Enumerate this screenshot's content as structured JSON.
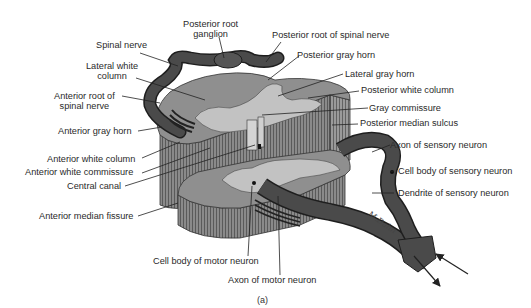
{
  "figure": {
    "caption": "(a)",
    "signature": "M.Dahn",
    "colors": {
      "white_matter": "#8f8f8f",
      "gray_matter": "#bdbdbd",
      "nerve": "#4a4a4a",
      "nerve_outline": "#1e1e1e",
      "striation": "#6b6b6b",
      "label_text": "#2a2a2a",
      "leader_line": "#222222"
    }
  },
  "labels": {
    "posterior_root_ganglion": "Posterior root ganglion",
    "posterior_root_ganglion_l1": "Posterior root",
    "posterior_root_ganglion_l2": "ganglion",
    "spinal_nerve": "Spinal nerve",
    "lateral_white_column_l1": "Lateral white",
    "lateral_white_column_l2": "column",
    "anterior_root_l1": "Anterior root of",
    "anterior_root_l2": "spinal nerve",
    "anterior_gray_horn": "Anterior gray horn",
    "anterior_white_column": "Anterior white column",
    "anterior_white_commissure": "Anterior white commissure",
    "central_canal": "Central canal",
    "anterior_median_fissure": "Anterior median fissure",
    "posterior_root_of_spinal_nerve": "Posterior root of spinal nerve",
    "posterior_gray_horn": "Posterior gray horn",
    "lateral_gray_horn": "Lateral gray horn",
    "posterior_white_column": "Posterior white column",
    "gray_commissure": "Gray commissure",
    "posterior_median_sulcus": "Posterior median sulcus",
    "axon_of_sensory_neuron": "Axon of sensory neuron",
    "cell_body_of_sensory_neuron": "Cell body of sensory neuron",
    "dendrite_of_sensory_neuron": "Dendrite of sensory neuron",
    "cell_body_of_motor_neuron": "Cell body of motor neuron",
    "axon_of_motor_neuron": "Axon of motor neuron"
  }
}
